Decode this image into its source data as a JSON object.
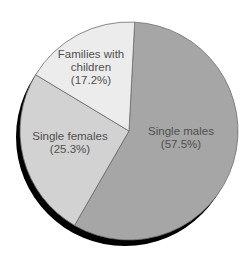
{
  "chart_data": {
    "type": "pie",
    "title": "",
    "start_angle_deg": 3,
    "direction": "clockwise",
    "categories": [
      "Single males",
      "Single females",
      "Families with children"
    ],
    "values": [
      57.5,
      25.3,
      17.2
    ],
    "unit": "%",
    "slices": [
      {
        "label": "Single males",
        "value": 57.5,
        "display": "(57.5%)",
        "color": "#a6a6a6"
      },
      {
        "label": "Single females",
        "value": 25.3,
        "display": "(25.3%)",
        "color": "#d2d2d2"
      },
      {
        "label": "Families with children",
        "value": 17.2,
        "display": "(17.2%)",
        "color": "#ececec"
      }
    ],
    "legend": "none (labels inside slices)",
    "shadow_color": "#000000",
    "edge_color": "#6e6e6e"
  },
  "labels": {
    "males": {
      "line1": "Single males",
      "line2": "(57.5%)"
    },
    "females": {
      "line1": "Single females",
      "line2": "(25.3%)"
    },
    "families": {
      "line1": "Families with",
      "line2": "children",
      "line3": "(17.2%)"
    }
  }
}
